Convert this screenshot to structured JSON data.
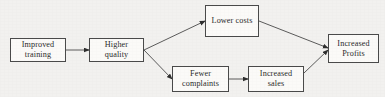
{
  "diagram": {
    "type": "flowchart",
    "background_color": "#f2f1ef",
    "box_fill_color": "#fbfaf8",
    "box_border_color": "#4a4a4a",
    "text_color": "#2b2b2b",
    "nodes": [
      {
        "id": "improved-training",
        "label": "Improved\ntraining",
        "x": 10,
        "y": 38,
        "width": 56,
        "height": 24
      },
      {
        "id": "higher-quality",
        "label": "Higher\nquality",
        "x": 89,
        "y": 38,
        "width": 55,
        "height": 24
      },
      {
        "id": "lower-costs",
        "label": "Lower costs",
        "x": 205,
        "y": 5,
        "width": 54,
        "height": 32
      },
      {
        "id": "fewer-complaints",
        "label": "Fewer\ncomplaints",
        "x": 172,
        "y": 66,
        "width": 57,
        "height": 26
      },
      {
        "id": "increased-sales",
        "label": "Increased\nsales",
        "x": 248,
        "y": 66,
        "width": 56,
        "height": 26
      },
      {
        "id": "increased-profits",
        "label": "Increased\nProfits",
        "x": 328,
        "y": 34,
        "width": 51,
        "height": 29
      }
    ],
    "connectors": [
      {
        "id": "training-to-quality",
        "from": "improved-training",
        "to": "higher-quality",
        "x1": 66,
        "y1": 50,
        "x2": 89,
        "y2": 50
      },
      {
        "id": "quality-to-lower-costs",
        "from": "higher-quality",
        "to": "lower-costs",
        "x1": 144,
        "y1": 50,
        "x2": 205,
        "y2": 21
      },
      {
        "id": "quality-to-fewer-complaints",
        "from": "higher-quality",
        "to": "fewer-complaints",
        "x1": 144,
        "y1": 50,
        "x2": 172,
        "y2": 79
      },
      {
        "id": "lower-costs-to-profits",
        "from": "lower-costs",
        "to": "increased-profits",
        "x1": 259,
        "y1": 21,
        "x2": 328,
        "y2": 48
      },
      {
        "id": "fewer-complaints-to-sales",
        "from": "fewer-complaints",
        "to": "increased-sales",
        "x1": 229,
        "y1": 79,
        "x2": 248,
        "y2": 79
      },
      {
        "id": "sales-to-profits",
        "from": "increased-sales",
        "to": "increased-profits",
        "x1": 304,
        "y1": 73,
        "x2": 328,
        "y2": 50
      }
    ]
  }
}
